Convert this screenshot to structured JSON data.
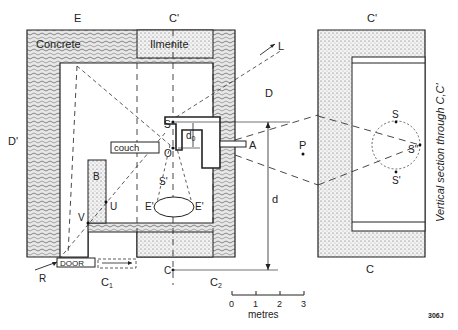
{
  "figure_id": "306J",
  "plan": {
    "top_labels": {
      "E": "E",
      "C_prime": "C'"
    },
    "materials": {
      "concrete": "Concrete",
      "ilmenite": "Ilmenite"
    },
    "labels": {
      "L": "L",
      "D": "D",
      "D_prime": "D'",
      "couch": "couch",
      "S": "S",
      "O": "O",
      "d0": "d",
      "d0_sub": "0",
      "A": "A",
      "B": "B",
      "U": "U",
      "V": "V",
      "S_prime": "S'",
      "E_prime_left": "E'",
      "E_prime_right": "E'",
      "R": "R",
      "door": "DOOR",
      "C": "C",
      "C1": "C",
      "C1_sub": "1",
      "C2": "C",
      "C2_sub": "2",
      "d": "d",
      "P": "P"
    }
  },
  "scale_bar": {
    "ticks": [
      "0",
      "1",
      "2",
      "3"
    ],
    "unit": "metres"
  },
  "section": {
    "top_label": "C'",
    "bottom_label": "C",
    "caption": "Vertical section through C,C'",
    "labels": {
      "S": "S",
      "S_double_prime": "S\"",
      "S_prime": "S'"
    }
  },
  "colors": {
    "ink": "#222222",
    "background": "#ffffff",
    "concrete_fill": "#e6e6e6",
    "ilmenite_fill": "#f0f0f0"
  }
}
